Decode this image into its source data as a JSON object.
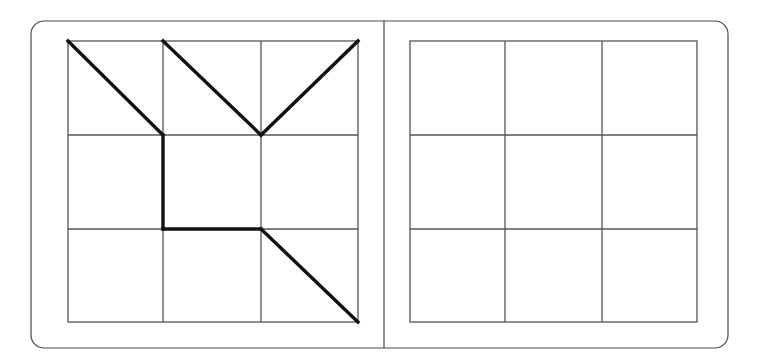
{
  "canvas": {
    "width": 758,
    "height": 363,
    "background": "#ffffff"
  },
  "frame": {
    "label": "Puzzle frame",
    "x": 31,
    "y": 21,
    "width": 697,
    "height": 327,
    "corner_radius": 13,
    "stroke": "#4a4a4a",
    "stroke_width": 1.2,
    "fill": "#ffffff"
  },
  "divider": {
    "label": "Panel divider",
    "x": 384,
    "y1": 21,
    "y2": 348,
    "stroke": "#4a4a4a",
    "stroke_width": 1.2
  },
  "panels": [
    {
      "id": "left-panel",
      "name": "pattern-panel",
      "role": "Pattern stimulus with drawn line segments",
      "grid": {
        "x": 68,
        "y": 41,
        "width": 290,
        "height": 281,
        "rows": 3,
        "cols": 3,
        "col_edges": [
          68,
          163,
          261,
          358
        ],
        "row_edges": [
          41,
          135,
          229,
          322
        ],
        "stroke": "#555555",
        "stroke_width": 1.3
      },
      "strokes": {
        "stroke": "#111111",
        "stroke_width": 3.4,
        "linecap": "square",
        "segments": [
          {
            "name": "diagonal-r1c1",
            "x1": 68,
            "y1": 41,
            "x2": 163,
            "y2": 135,
            "description": "diagonal top-left to bottom-right in row1 col1"
          },
          {
            "name": "diagonal-r1c2",
            "x1": 163,
            "y1": 41,
            "x2": 261,
            "y2": 135,
            "description": "diagonal top-left to bottom-right in row1 col2"
          },
          {
            "name": "diagonal-r1c3",
            "x1": 358,
            "y1": 41,
            "x2": 261,
            "y2": 135,
            "description": "diagonal top-right to bottom-left in row1 col3"
          },
          {
            "name": "vertical-c2-r2",
            "x1": 163,
            "y1": 135,
            "x2": 163,
            "y2": 229,
            "description": "vertical left edge of row2 col2"
          },
          {
            "name": "horizontal-r3-c2",
            "x1": 163,
            "y1": 229,
            "x2": 261,
            "y2": 229,
            "description": "horizontal top edge of row3 col2"
          },
          {
            "name": "diagonal-r3c3",
            "x1": 261,
            "y1": 229,
            "x2": 358,
            "y2": 322,
            "description": "diagonal top-left to bottom-right in row3 col3"
          }
        ]
      }
    },
    {
      "id": "right-panel",
      "name": "answer-panel",
      "role": "Empty response grid",
      "grid": {
        "x": 410,
        "y": 41,
        "width": 287,
        "height": 281,
        "rows": 3,
        "cols": 3,
        "col_edges": [
          410,
          505,
          602,
          697
        ],
        "row_edges": [
          41,
          135,
          229,
          322
        ],
        "stroke": "#555555",
        "stroke_width": 1.3
      },
      "strokes": {
        "stroke": "#111111",
        "stroke_width": 3.4,
        "linecap": "square",
        "segments": []
      }
    }
  ]
}
